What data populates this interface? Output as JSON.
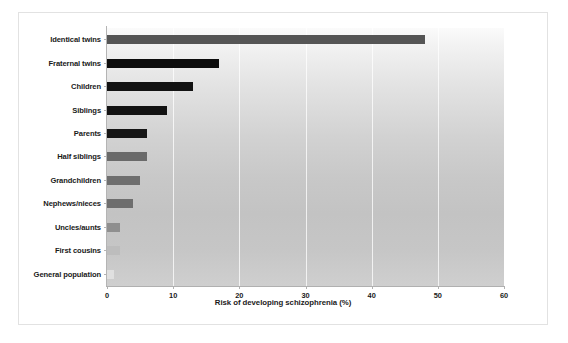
{
  "chart_data": {
    "type": "bar",
    "orientation": "horizontal",
    "title": "",
    "xlabel": "Risk of developing schizophrenia (%)",
    "ylabel": "",
    "xlim": [
      0,
      60
    ],
    "xticks": [
      0,
      10,
      20,
      30,
      40,
      50,
      60
    ],
    "grid": "vertical",
    "legend": "none",
    "categories": [
      "Identical twins",
      "Fraternal twins",
      "Children",
      "Siblings",
      "Parents",
      "Half siblings",
      "Grandchildren",
      "Nephews/nieces",
      "Uncles/aunts",
      "First cousins",
      "General population"
    ],
    "values": [
      48,
      17,
      13,
      9,
      6,
      6,
      5,
      4,
      2,
      2,
      1
    ],
    "bar_colors": [
      "#555555",
      "#0d0d0d",
      "#121212",
      "#121212",
      "#161616",
      "#6a6a6a",
      "#6e6e6e",
      "#6e6e6e",
      "#8f8f8f",
      "#bdbdbd",
      "#e0e0e0"
    ]
  },
  "figure": {
    "frame_color": "#e2e2e2",
    "background": "#ffffff",
    "axis_color": "#b0b0b0",
    "gridline_color": "#ffffff"
  }
}
